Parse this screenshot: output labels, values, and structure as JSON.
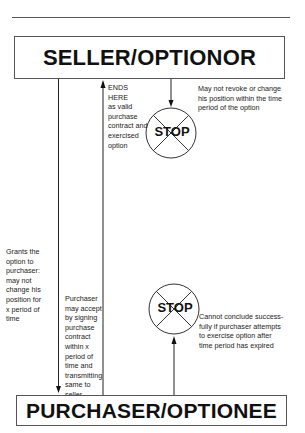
{
  "diagram": {
    "seller_box": {
      "label": "SELLER/OPTIONOR"
    },
    "purchaser_box": {
      "label": "PURCHASER/OPTIONEE"
    },
    "arrows": [
      {
        "from": "seller",
        "to": "purchaser",
        "direction": "down",
        "label": "Grants the\noption to\npurchaser:\nmay not\nchange his\nposition for\nx period of\ntime"
      },
      {
        "from": "purchaser",
        "to": "seller",
        "direction": "up",
        "label": "ENDS\nHERE\nas valid\npurchase\ncontract and\nexercised\noption"
      },
      {
        "from": "purchaser",
        "to": "seller",
        "direction": "down-annotation",
        "label": "Purchaser\nmay accept\nby signing\npurchase\ncontract\nwithin x\nperiod of\ntime and\ntransmitting\nsame to\nseller"
      },
      {
        "from": "seller",
        "to": "stop-top",
        "direction": "down",
        "label": ""
      },
      {
        "from": "purchaser",
        "to": "stop-bottom",
        "direction": "up",
        "label": ""
      }
    ],
    "stop_signs": [
      {
        "label": "STOP",
        "note": "May not revoke or change\nhis position within the time\nperiod of the option"
      },
      {
        "label": "STOP",
        "note": "Cannot conclude success-\nfully if purchaser attempts\nto exercise option after\ntime period has expired"
      }
    ]
  }
}
